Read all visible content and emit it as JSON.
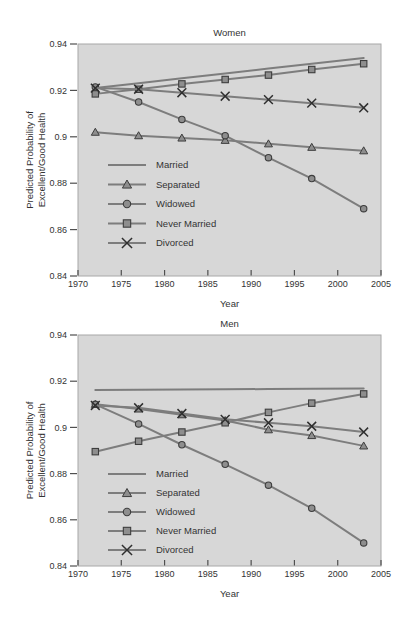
{
  "figure": {
    "background": "#ffffff",
    "plot_background": "#d7d7d7",
    "frame_color": "#a8a8a8",
    "line_color": "#7d7d7d",
    "marker_fill": "#8e8e8e",
    "marker_stroke": "#3d3d3d",
    "x_marker_color": "#2f2f2f",
    "text_color": "#333333",
    "tick_color": "#4f4f4f"
  },
  "chart_data": [
    {
      "type": "line",
      "title": "Women",
      "xlabel": "Year",
      "ylabel_lines": [
        "Predicted Probability of",
        "Excellent/Good Health"
      ],
      "xlim": [
        1970,
        2005
      ],
      "ylim": [
        0.84,
        0.94
      ],
      "xticks": [
        1970,
        1975,
        1980,
        1985,
        1990,
        1995,
        2000,
        2005
      ],
      "xtick_labels": [
        "1970",
        "1975",
        "1980",
        "1985",
        "1990",
        "1995",
        "2000",
        "2005"
      ],
      "yticks": [
        0.84,
        0.86,
        0.88,
        0.9,
        0.92,
        0.94
      ],
      "ytick_labels": [
        "0.84",
        "0.86",
        "0.88",
        "0.9",
        "0.92",
        "0.94"
      ],
      "grid": false,
      "legend_position": "lower-left",
      "legend_labels": [
        "Married",
        "Separated",
        "Widowed",
        "Never Married",
        "Divorced"
      ],
      "x": [
        1972,
        1977,
        1982,
        1987,
        1992,
        1997,
        2003
      ],
      "series": [
        {
          "name": "Married",
          "marker": "none",
          "values": [
            0.921,
            0.9231,
            0.9252,
            0.9273,
            0.9294,
            0.9315,
            0.934
          ]
        },
        {
          "name": "Separated",
          "marker": "triangle",
          "values": [
            0.902,
            0.9005,
            0.8995,
            0.8985,
            0.897,
            0.8955,
            0.894
          ]
        },
        {
          "name": "Widowed",
          "marker": "circle",
          "values": [
            0.9215,
            0.915,
            0.9075,
            0.9005,
            0.891,
            0.882,
            0.869
          ]
        },
        {
          "name": "Never Married",
          "marker": "square",
          "values": [
            0.9185,
            0.9205,
            0.9228,
            0.9247,
            0.9266,
            0.929,
            0.9315
          ]
        },
        {
          "name": "Divorced",
          "marker": "x",
          "values": [
            0.921,
            0.9205,
            0.919,
            0.9175,
            0.916,
            0.9145,
            0.9125
          ]
        }
      ]
    },
    {
      "type": "line",
      "title": "Men",
      "xlabel": "Year",
      "ylabel_lines": [
        "Predicted Probability of",
        "Excellent/Good Health"
      ],
      "xlim": [
        1970,
        2005
      ],
      "ylim": [
        0.84,
        0.94
      ],
      "xticks": [
        1970,
        1975,
        1980,
        1985,
        1990,
        1995,
        2000,
        2005
      ],
      "xtick_labels": [
        "1970",
        "1975",
        "1980",
        "1985",
        "1990",
        "1995",
        "2000",
        "2005"
      ],
      "yticks": [
        0.84,
        0.86,
        0.88,
        0.9,
        0.92,
        0.94
      ],
      "ytick_labels": [
        "0.84",
        "0.86",
        "0.88",
        "0.9",
        "0.92",
        "0.94"
      ],
      "grid": false,
      "legend_position": "lower-left",
      "legend_labels": [
        "Married",
        "Separated",
        "Widowed",
        "Never Married",
        "Divorced"
      ],
      "x": [
        1972,
        1977,
        1982,
        1987,
        1992,
        1997,
        2003
      ],
      "series": [
        {
          "name": "Married",
          "marker": "none",
          "values": [
            0.9162,
            0.9163,
            0.9164,
            0.9165,
            0.9166,
            0.9167,
            0.9168
          ]
        },
        {
          "name": "Separated",
          "marker": "triangle",
          "values": [
            0.91,
            0.908,
            0.9055,
            0.903,
            0.899,
            0.8965,
            0.892
          ]
        },
        {
          "name": "Widowed",
          "marker": "circle",
          "values": [
            0.91,
            0.9015,
            0.8925,
            0.884,
            0.875,
            0.865,
            0.85
          ]
        },
        {
          "name": "Never Married",
          "marker": "square",
          "values": [
            0.8895,
            0.894,
            0.898,
            0.902,
            0.9065,
            0.9105,
            0.9145
          ]
        },
        {
          "name": "Divorced",
          "marker": "x",
          "values": [
            0.9095,
            0.9085,
            0.906,
            0.9035,
            0.902,
            0.9005,
            0.898
          ]
        }
      ]
    }
  ]
}
